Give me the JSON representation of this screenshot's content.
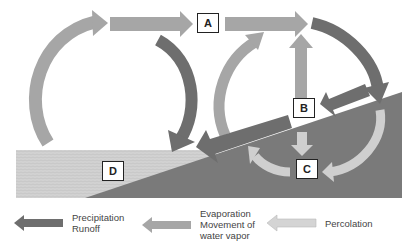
{
  "diagram": {
    "title": "",
    "type": "water-cycle",
    "labels": {
      "a": "A",
      "b": "B",
      "c": "C",
      "d": "D"
    },
    "colors": {
      "precipitation_runoff": "#6e6e6e",
      "evaporation_vapor": "#a6a6a6",
      "percolation": "#cfcfcf",
      "land": "#7a7a7a",
      "water": "#cdcdcd"
    }
  },
  "legend": {
    "items": [
      {
        "key": "precipitation_runoff",
        "lines": [
          "Precipitation",
          "Runoff"
        ]
      },
      {
        "key": "evaporation_vapor",
        "lines": [
          "Evaporation",
          "Movement of",
          "water vapor"
        ]
      },
      {
        "key": "percolation",
        "lines": [
          "Percolation"
        ]
      }
    ]
  }
}
